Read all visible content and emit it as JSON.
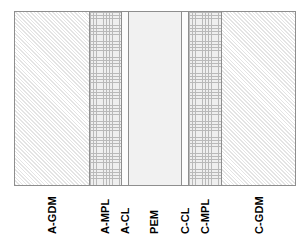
{
  "figure": {
    "type": "cross-section-diagram",
    "orientation": "horizontal stack, anode on the left, cathode on the right",
    "canvas": {
      "width": 308,
      "height": 236
    },
    "plot_area": {
      "x": 14,
      "y": 11,
      "width": 282,
      "height": 175
    },
    "background_color": "#ffffff",
    "outline_color": "#8e8e8e"
  },
  "layers": [
    {
      "id": "a-gdm",
      "label": "A-GDM",
      "name": "Anode Gas Diffusion Medium",
      "width_px": 74,
      "fill": "diagonal-hatch",
      "fill_color": "#e4e4e4",
      "hatch_color": "#ffffff"
    },
    {
      "id": "a-mpl",
      "label": "A-MPL",
      "name": "Anode Microporous Layer",
      "width_px": 32,
      "fill": "crosshatch",
      "fill_color": "#efefef",
      "hatch_color": "#b9b9b9"
    },
    {
      "id": "a-cl",
      "label": "A-CL",
      "name": "Anode Catalyst Layer",
      "width_px": 7,
      "fill": "plain-light",
      "fill_color": "#fcfcfc",
      "hatch_color": ""
    },
    {
      "id": "pem",
      "label": "PEM",
      "name": "Polymer Electrolyte Membrane",
      "width_px": 53,
      "fill": "plain-grey",
      "fill_color": "#f1f1f1",
      "hatch_color": ""
    },
    {
      "id": "c-cl",
      "label": "C-CL",
      "name": "Cathode Catalyst Layer",
      "width_px": 7,
      "fill": "plain-light",
      "fill_color": "#fcfcfc",
      "hatch_color": ""
    },
    {
      "id": "c-mpl",
      "label": "C-MPL",
      "name": "Cathode Microporous Layer",
      "width_px": 33,
      "fill": "crosshatch",
      "fill_color": "#efefef",
      "hatch_color": "#b9b9b9"
    },
    {
      "id": "c-gdm",
      "label": "C-GDM",
      "name": "Cathode Gas Diffusion Medium",
      "width_px": 74,
      "fill": "diagonal-hatch",
      "fill_color": "#e4e4e4",
      "hatch_color": "#ffffff"
    }
  ],
  "captions": {
    "rotation_deg": -90,
    "font_size_px": 11,
    "font_weight": "bold",
    "color": "#000000",
    "items": [
      {
        "text": "A-GDM",
        "center_x": 51
      },
      {
        "text": "A-MPL",
        "center_x": 104
      },
      {
        "text": "A-CL",
        "center_x": 124
      },
      {
        "text": "PEM",
        "center_x": 153
      },
      {
        "text": "C-CL",
        "center_x": 184
      },
      {
        "text": "C-MPL",
        "center_x": 204
      },
      {
        "text": "C-GDM",
        "center_x": 258
      }
    ]
  }
}
